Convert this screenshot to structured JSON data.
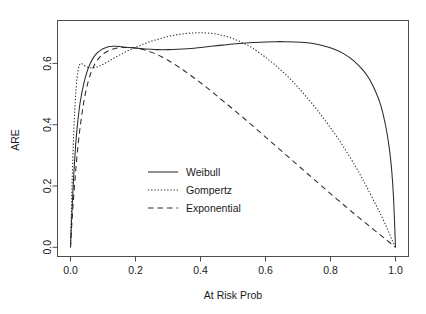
{
  "chart_data": {
    "type": "line",
    "title": "",
    "xlabel": "At Risk Prob",
    "ylabel": "ARE",
    "xlim": [
      -0.04,
      1.04
    ],
    "ylim": [
      -0.03,
      0.74
    ],
    "grid": false,
    "legend_position": "center-left",
    "xticks": [
      "0.0",
      "0.2",
      "0.4",
      "0.6",
      "0.8",
      "1.0"
    ],
    "xtick_values": [
      0.0,
      0.2,
      0.4,
      0.6,
      0.8,
      1.0
    ],
    "yticks": [
      "0.0",
      "0.2",
      "0.4",
      "0.6"
    ],
    "ytick_values": [
      0.0,
      0.2,
      0.4,
      0.6
    ],
    "series": [
      {
        "name": "Weibull",
        "style": "solid",
        "x": [
          0.0,
          0.003,
          0.006,
          0.01,
          0.015,
          0.02,
          0.025,
          0.03,
          0.04,
          0.05,
          0.06,
          0.07,
          0.08,
          0.09,
          0.1,
          0.11,
          0.12,
          0.13,
          0.14,
          0.15,
          0.17,
          0.19,
          0.21,
          0.23,
          0.25,
          0.27,
          0.3,
          0.33,
          0.36,
          0.4,
          0.44,
          0.48,
          0.52,
          0.56,
          0.6,
          0.63,
          0.66,
          0.69,
          0.72,
          0.75,
          0.78,
          0.81,
          0.84,
          0.87,
          0.9,
          0.92,
          0.94,
          0.955,
          0.97,
          0.98,
          0.988,
          0.994,
          1.0
        ],
        "y": [
          0.0,
          0.08,
          0.15,
          0.235,
          0.32,
          0.385,
          0.435,
          0.475,
          0.53,
          0.57,
          0.598,
          0.618,
          0.632,
          0.641,
          0.648,
          0.652,
          0.655,
          0.656,
          0.656,
          0.655,
          0.653,
          0.651,
          0.649,
          0.647,
          0.646,
          0.645,
          0.645,
          0.646,
          0.648,
          0.652,
          0.657,
          0.661,
          0.665,
          0.668,
          0.67,
          0.671,
          0.671,
          0.67,
          0.668,
          0.664,
          0.657,
          0.647,
          0.632,
          0.61,
          0.578,
          0.548,
          0.505,
          0.462,
          0.395,
          0.33,
          0.255,
          0.16,
          0.0
        ]
      },
      {
        "name": "Gompertz",
        "style": "dotted",
        "x": [
          0.0,
          0.002,
          0.004,
          0.007,
          0.01,
          0.013,
          0.016,
          0.02,
          0.024,
          0.028,
          0.032,
          0.036,
          0.04,
          0.05,
          0.06,
          0.07,
          0.08,
          0.09,
          0.1,
          0.115,
          0.13,
          0.15,
          0.17,
          0.19,
          0.21,
          0.23,
          0.25,
          0.27,
          0.29,
          0.31,
          0.33,
          0.35,
          0.37,
          0.39,
          0.41,
          0.44,
          0.47,
          0.5,
          0.53,
          0.56,
          0.6,
          0.64,
          0.68,
          0.72,
          0.76,
          0.8,
          0.84,
          0.88,
          0.91,
          0.94,
          0.96,
          0.975,
          0.988,
          1.0
        ],
        "y": [
          0.0,
          0.09,
          0.175,
          0.285,
          0.375,
          0.445,
          0.5,
          0.552,
          0.582,
          0.596,
          0.6,
          0.598,
          0.595,
          0.589,
          0.586,
          0.586,
          0.588,
          0.592,
          0.597,
          0.606,
          0.615,
          0.627,
          0.638,
          0.648,
          0.657,
          0.665,
          0.673,
          0.679,
          0.685,
          0.69,
          0.694,
          0.697,
          0.699,
          0.7,
          0.7,
          0.697,
          0.691,
          0.681,
          0.667,
          0.65,
          0.62,
          0.585,
          0.545,
          0.498,
          0.447,
          0.39,
          0.328,
          0.258,
          0.2,
          0.138,
          0.095,
          0.06,
          0.027,
          0.0
        ]
      },
      {
        "name": "Exponential",
        "style": "dashed",
        "x": [
          0.0,
          0.004,
          0.008,
          0.013,
          0.018,
          0.024,
          0.03,
          0.038,
          0.046,
          0.055,
          0.065,
          0.075,
          0.085,
          0.095,
          0.105,
          0.12,
          0.135,
          0.15,
          0.165,
          0.18,
          0.2,
          0.22,
          0.25,
          0.28,
          0.31,
          0.35,
          0.39,
          0.43,
          0.47,
          0.51,
          0.55,
          0.59,
          0.63,
          0.67,
          0.71,
          0.75,
          0.79,
          0.83,
          0.87,
          0.9,
          0.93,
          0.955,
          0.975,
          0.99,
          1.0
        ],
        "y": [
          0.0,
          0.075,
          0.14,
          0.21,
          0.275,
          0.34,
          0.395,
          0.455,
          0.503,
          0.543,
          0.575,
          0.598,
          0.614,
          0.626,
          0.634,
          0.643,
          0.648,
          0.651,
          0.652,
          0.652,
          0.65,
          0.646,
          0.636,
          0.622,
          0.604,
          0.576,
          0.545,
          0.512,
          0.477,
          0.442,
          0.406,
          0.369,
          0.332,
          0.295,
          0.258,
          0.221,
          0.184,
          0.148,
          0.112,
          0.086,
          0.06,
          0.039,
          0.022,
          0.009,
          0.0
        ]
      }
    ]
  },
  "legend": {
    "entries": [
      {
        "label": "Weibull"
      },
      {
        "label": "Gompertz"
      },
      {
        "label": "Exponential"
      }
    ]
  }
}
